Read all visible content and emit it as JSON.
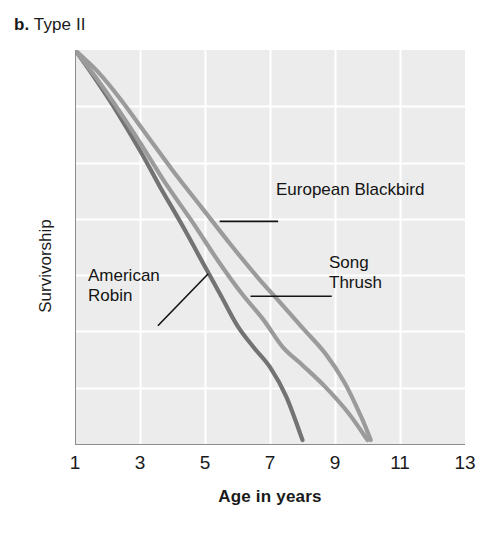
{
  "panel": {
    "letter": "b.",
    "title": "Type II"
  },
  "chart_data": {
    "type": "line",
    "title": "Type II",
    "xlabel": "Age in years",
    "ylabel": "Survivorship",
    "xlim": [
      1,
      13
    ],
    "ylim": [
      0,
      1
    ],
    "xticks": [
      1,
      3,
      5,
      7,
      9,
      11,
      13
    ],
    "yticks": [],
    "grid": true,
    "grid_color": "#ffffff",
    "plot_background": "#ececec",
    "legend": "callout-labels",
    "note": "Semi-log style survivorship curves; y axis unlabeled (Survivorship, decreasing).",
    "series": [
      {
        "name": "American Robin",
        "color": "#737373",
        "points": [
          {
            "x": 1.0,
            "y": 1.0
          },
          {
            "x": 1.6,
            "y": 0.93
          },
          {
            "x": 2.2,
            "y": 0.855
          },
          {
            "x": 3.0,
            "y": 0.745
          },
          {
            "x": 3.6,
            "y": 0.655
          },
          {
            "x": 4.3,
            "y": 0.555
          },
          {
            "x": 5.0,
            "y": 0.45
          },
          {
            "x": 5.5,
            "y": 0.375
          },
          {
            "x": 6.0,
            "y": 0.3
          },
          {
            "x": 6.5,
            "y": 0.245
          },
          {
            "x": 7.0,
            "y": 0.195
          },
          {
            "x": 7.5,
            "y": 0.12
          },
          {
            "x": 8.0,
            "y": 0.01
          }
        ]
      },
      {
        "name": "Song Thrush",
        "color": "#9b9b9b",
        "points": [
          {
            "x": 1.0,
            "y": 1.0
          },
          {
            "x": 1.6,
            "y": 0.935
          },
          {
            "x": 2.2,
            "y": 0.865
          },
          {
            "x": 3.0,
            "y": 0.765
          },
          {
            "x": 3.8,
            "y": 0.66
          },
          {
            "x": 4.6,
            "y": 0.565
          },
          {
            "x": 5.4,
            "y": 0.465
          },
          {
            "x": 6.1,
            "y": 0.385
          },
          {
            "x": 6.8,
            "y": 0.315
          },
          {
            "x": 7.4,
            "y": 0.245
          },
          {
            "x": 8.0,
            "y": 0.2
          },
          {
            "x": 8.7,
            "y": 0.145
          },
          {
            "x": 9.4,
            "y": 0.08
          },
          {
            "x": 10.0,
            "y": 0.01
          }
        ]
      },
      {
        "name": "European Blackbird",
        "color": "#9b9b9b",
        "points": [
          {
            "x": 1.0,
            "y": 1.0
          },
          {
            "x": 1.7,
            "y": 0.945
          },
          {
            "x": 2.4,
            "y": 0.875
          },
          {
            "x": 3.2,
            "y": 0.785
          },
          {
            "x": 4.0,
            "y": 0.695
          },
          {
            "x": 4.9,
            "y": 0.6
          },
          {
            "x": 5.8,
            "y": 0.505
          },
          {
            "x": 6.6,
            "y": 0.425
          },
          {
            "x": 7.3,
            "y": 0.36
          },
          {
            "x": 8.0,
            "y": 0.295
          },
          {
            "x": 8.7,
            "y": 0.23
          },
          {
            "x": 9.3,
            "y": 0.155
          },
          {
            "x": 9.8,
            "y": 0.07
          },
          {
            "x": 10.1,
            "y": 0.01
          }
        ]
      }
    ],
    "callouts": [
      {
        "name": "European Blackbird",
        "text": "European Blackbird",
        "leader": {
          "from_x": 5.45,
          "from_y": 0.565,
          "to_x": 7.25,
          "to_y": 0.565
        }
      },
      {
        "name": "Song Thrush",
        "text": "Song\nThrush",
        "leader": {
          "from_x": 6.4,
          "from_y": 0.375,
          "to_x": 8.9,
          "to_y": 0.375
        }
      },
      {
        "name": "American Robin",
        "text": "American\nRobin",
        "leader": {
          "from_x": 5.1,
          "from_y": 0.432,
          "to_x": 3.55,
          "to_y": 0.3
        }
      }
    ]
  },
  "axes": {
    "x_title": "Age in years",
    "y_title": "Survivorship",
    "x_tick_labels": [
      "1",
      "3",
      "5",
      "7",
      "9",
      "11",
      "13"
    ]
  },
  "colors": {
    "plot_background": "#ececec",
    "gridline": "#ffffff",
    "axis_line": "#8c8c8c",
    "curve_dark": "#737373",
    "curve_light": "#9b9b9b",
    "text": "#141414",
    "page_background": "#ffffff"
  }
}
